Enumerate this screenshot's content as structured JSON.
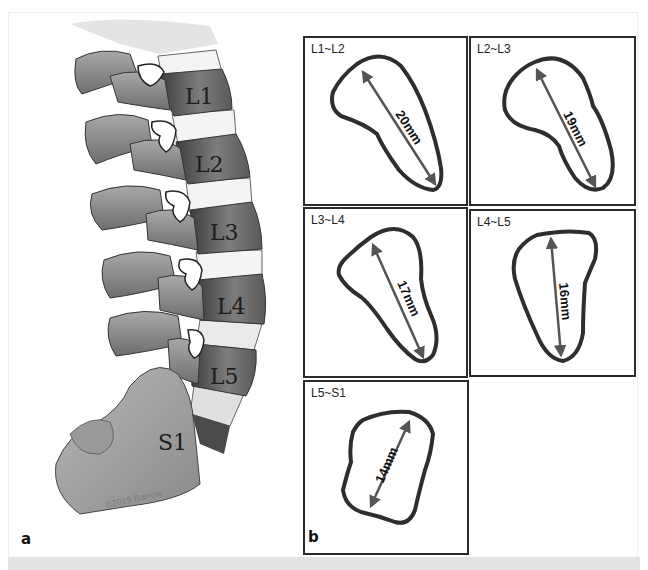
{
  "figure": {
    "panel_a": {
      "letter": "a",
      "vertebra_labels": [
        "L1",
        "L2",
        "L3",
        "L4",
        "L5",
        "S1"
      ],
      "copyright": "©2019 Barrow"
    },
    "panel_b": {
      "letter": "b",
      "levels": [
        {
          "label": "L1~L2",
          "measurement": "20mm"
        },
        {
          "label": "L2~L3",
          "measurement": "19mm"
        },
        {
          "label": "L3~L4",
          "measurement": "17mm"
        },
        {
          "label": "L4~L5",
          "measurement": "16mm"
        },
        {
          "label": "L5~S1",
          "measurement": "14mm"
        }
      ]
    }
  },
  "colors": {
    "bone_dark": "#4a4a4a",
    "bone_mid": "#8c8c8c",
    "bone_light": "#c9c9c9",
    "disc": "#f2f2f2",
    "foramen_outline": "#3a3a3a",
    "arrow": "#555555"
  }
}
